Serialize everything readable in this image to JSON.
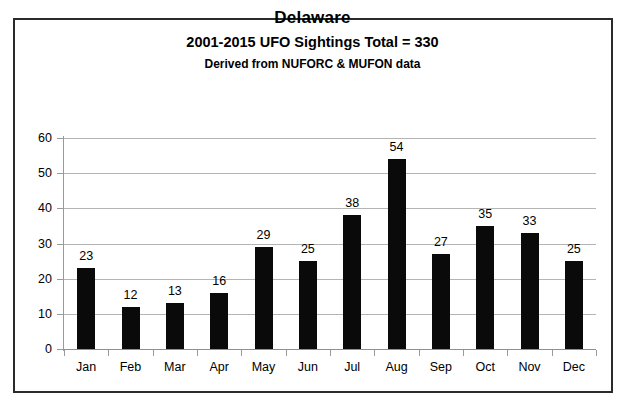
{
  "chart_data": {
    "type": "bar",
    "title": "Delaware",
    "subtitle": "2001-2015 UFO Sightings Total = 330",
    "subtitle2": "Derived from NUFORC  & MUFON data",
    "categories": [
      "Jan",
      "Feb",
      "Mar",
      "Apr",
      "May",
      "Jun",
      "Jul",
      "Aug",
      "Sep",
      "Oct",
      "Nov",
      "Dec"
    ],
    "values": [
      23,
      12,
      13,
      16,
      29,
      25,
      38,
      54,
      27,
      35,
      33,
      25
    ],
    "xlabel": "",
    "ylabel": "",
    "ylim": [
      0,
      60
    ],
    "yticks": [
      0,
      10,
      20,
      30,
      40,
      50,
      60
    ],
    "ytick_labels": [
      "0",
      "10",
      "20",
      "30",
      "40",
      "50",
      "60"
    ],
    "grid": true,
    "legend": false,
    "bar_color": "#0a0a0a",
    "gridline_color": "#b4b4b4",
    "background_color": "#ffffff",
    "border_color": "#2b2b2b",
    "total": 330,
    "data_labels": [
      "23",
      "12",
      "13",
      "16",
      "29",
      "25",
      "38",
      "54",
      "27",
      "35",
      "33",
      "25"
    ]
  }
}
